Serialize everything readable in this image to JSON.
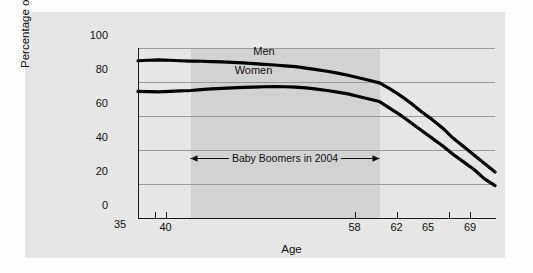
{
  "chart_data": {
    "type": "line",
    "title": "",
    "xlabel": "Age",
    "ylabel": "Percentage of population",
    "xlim": [
      35,
      69
    ],
    "ylim": [
      0,
      100
    ],
    "grid": true,
    "legend_position": "inline-above-curves",
    "x_ticks": [
      {
        "value": 35,
        "label": "35",
        "tick_mark": false
      },
      {
        "value": 39,
        "label": "",
        "tick_mark": true
      },
      {
        "value": 40,
        "label": "40",
        "tick_mark": true
      },
      {
        "value": 58,
        "label": "58",
        "tick_mark": true
      },
      {
        "value": 62,
        "label": "62",
        "tick_mark": true
      },
      {
        "value": 65,
        "label": "65",
        "tick_mark": false
      },
      {
        "value": 67,
        "label": "",
        "tick_mark": true
      },
      {
        "value": 69,
        "label": "69",
        "tick_mark": true
      }
    ],
    "y_ticks": [
      {
        "value": 0,
        "label": "0"
      },
      {
        "value": 20,
        "label": "20"
      },
      {
        "value": 40,
        "label": "40"
      },
      {
        "value": 60,
        "label": "60"
      },
      {
        "value": 80,
        "label": "80"
      },
      {
        "value": 100,
        "label": "100"
      }
    ],
    "x": [
      35,
      36,
      37,
      38,
      39,
      40,
      41,
      42,
      43,
      44,
      45,
      46,
      47,
      48,
      49,
      50,
      51,
      52,
      53,
      54,
      55,
      56,
      57,
      58,
      59,
      60,
      61,
      62,
      63,
      64,
      65,
      66,
      67,
      68,
      69
    ],
    "series": [
      {
        "name": "Men",
        "color": "#000000",
        "values": [
          92.5,
          92.8,
          93.0,
          92.8,
          92.5,
          92.3,
          92.2,
          92.0,
          91.8,
          91.5,
          91.2,
          90.8,
          90.4,
          90.0,
          89.5,
          89.0,
          88.2,
          87.3,
          86.3,
          85.2,
          84.0,
          82.5,
          81.0,
          79.5,
          76.0,
          72.0,
          67.5,
          62.5,
          58.0,
          53.0,
          47.0,
          42.0,
          37.0,
          32.0,
          27.0
        ],
        "label_x": 47,
        "label_y": 97.5
      },
      {
        "name": "Women",
        "color": "#000000",
        "values": [
          74.5,
          74.3,
          74.2,
          74.5,
          74.8,
          75.0,
          75.5,
          76.0,
          76.2,
          76.5,
          76.8,
          77.0,
          77.2,
          77.3,
          77.2,
          77.0,
          76.5,
          75.8,
          75.0,
          74.0,
          73.0,
          71.5,
          70.0,
          68.5,
          64.5,
          60.5,
          56.0,
          51.5,
          47.0,
          42.5,
          37.5,
          33.0,
          28.5,
          23.0,
          19.0
        ],
        "label_x": 46,
        "label_y": 86.5
      }
    ],
    "annotations": [
      {
        "type": "double-arrow-span",
        "text": "Baby Boomers in 2004",
        "x_start": 40,
        "x_end": 58,
        "y": 35
      }
    ],
    "shaded_region": {
      "x_start": 40,
      "x_end": 58,
      "color": "#d2d2d2",
      "description": "Baby Boomers in 2004"
    },
    "colors": {
      "panel_background": "#e6e6e6",
      "band": "#d2d2d2",
      "gridline": "#9a9a9a",
      "axis": "#1a1a1a",
      "line": "#000000"
    }
  }
}
